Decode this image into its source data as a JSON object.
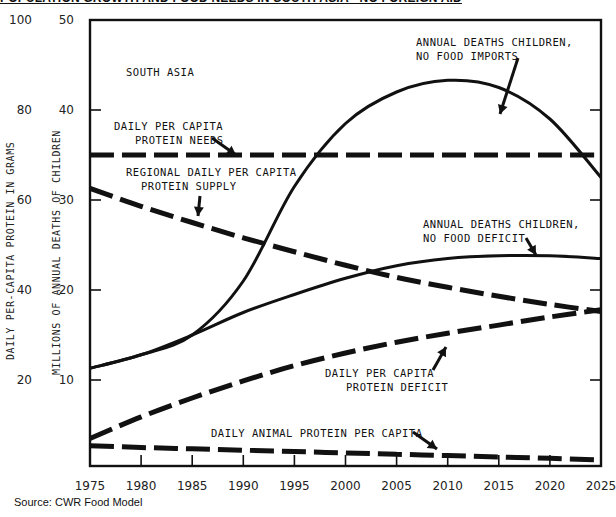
{
  "title": "POPULATION GROWTH AND FOOD NEEDS IN SOUTH ASIA - NO FOREIGN AID",
  "source": "Source: CWR Food Model",
  "chart_data": {
    "type": "line",
    "title": "POPULATION GROWTH AND FOOD NEEDS IN SOUTH ASIA - NO FOREIGN AID",
    "region_label": "SOUTH ASIA",
    "xlabel": "",
    "ylabel_left": "DAILY PER-CAPITA PROTEIN IN GRAMS",
    "ylabel_right_inner": "MILLIONS OF ANNUAL DEATHS OF CHILDREN",
    "x": [
      1975,
      1980,
      1985,
      1990,
      1995,
      2000,
      2005,
      2010,
      2015,
      2020,
      2025
    ],
    "x_ticks": [
      "1975",
      "1980",
      "1985",
      "1990",
      "1995",
      "2000",
      "2005",
      "2010",
      "2015",
      "2020",
      "2025"
    ],
    "y_ticks_protein": [
      "100",
      "80",
      "60",
      "40",
      "20"
    ],
    "y_ticks_deaths": [
      "50",
      "40",
      "30",
      "20",
      "10"
    ],
    "ylim_deaths": [
      0,
      50
    ],
    "ylim_protein": [
      0,
      100
    ],
    "grid": false,
    "series": [
      {
        "name": "ANNUAL DEATHS CHILDREN, NO FOOD IMPORTS",
        "axis": "deaths",
        "style": "solid",
        "values": [
          11.3,
          12.8,
          15.0,
          21.0,
          31.5,
          38.5,
          42.0,
          43.3,
          42.5,
          39.0,
          32.5
        ]
      },
      {
        "name": "ANNUAL DEATHS CHILDREN, NO FOOD DEFICIT",
        "axis": "deaths",
        "style": "solid",
        "values": [
          11.3,
          12.8,
          15.0,
          17.5,
          19.5,
          21.3,
          22.7,
          23.5,
          23.8,
          23.8,
          23.5
        ]
      },
      {
        "name": "DAILY PER CAPITA PROTEIN NEEDS",
        "axis": "protein",
        "style": "dashed",
        "values": [
          70,
          70,
          70,
          70,
          70,
          70,
          70,
          70,
          70,
          70,
          70
        ]
      },
      {
        "name": "REGIONAL DAILY PER CAPITA PROTEIN SUPPLY",
        "axis": "protein",
        "style": "dashed",
        "values": [
          62.6,
          58.6,
          55.0,
          51.6,
          48.5,
          45.5,
          42.8,
          40.6,
          38.6,
          36.8,
          35.2
        ]
      },
      {
        "name": "DAILY PER CAPITA PROTEIN DEFICIT",
        "axis": "protein",
        "style": "dashed",
        "values": [
          7.0,
          11.8,
          16.0,
          19.8,
          23.2,
          26.0,
          28.4,
          30.4,
          32.2,
          34.0,
          35.6
        ]
      },
      {
        "name": "DAILY ANIMAL PROTEIN PER CAPITA",
        "axis": "protein",
        "style": "dashed",
        "values": [
          5.4,
          5.0,
          4.7,
          4.4,
          4.1,
          3.8,
          3.5,
          3.2,
          2.9,
          2.6,
          2.2
        ]
      }
    ],
    "annotations": [
      {
        "text": [
          "ANNUAL DEATHS CHILDREN,",
          "NO FOOD IMPORTS"
        ]
      },
      {
        "text": [
          "DAILY PER CAPITA",
          "PROTEIN NEEDS"
        ]
      },
      {
        "text": [
          "REGIONAL DAILY PER CAPITA",
          "PROTEIN SUPPLY"
        ]
      },
      {
        "text": [
          "ANNUAL DEATHS CHILDREN,",
          "NO FOOD DEFICIT"
        ]
      },
      {
        "text": [
          "DAILY PER CAPITA",
          "PROTEIN DEFICIT"
        ]
      },
      {
        "text": [
          "DAILY ANIMAL PROTEIN PER CAPITA"
        ]
      }
    ],
    "colors": {
      "line": "#111111",
      "background": "#ffffff"
    }
  }
}
